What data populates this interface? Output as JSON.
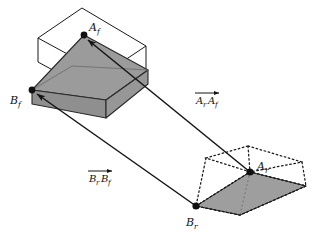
{
  "figure": {
    "type": "geometric-vector-diagram",
    "title": "",
    "background_color": "#ffffff",
    "stroke_color": "#1a1a1a",
    "fill_gray": "#9b9b9b",
    "fill_gray_flat": "#9e9e9e"
  },
  "points": {
    "A_f": {
      "label": "A",
      "subscript": "f",
      "x": 84,
      "y": 35,
      "marker": "filled-dot"
    },
    "B_f": {
      "label": "B",
      "subscript": "f",
      "x": 32,
      "y": 90,
      "marker": "filled-dot"
    },
    "A_r": {
      "label": "A",
      "subscript": "r",
      "x": 250,
      "y": 172,
      "marker": "filled-dot"
    },
    "B_r": {
      "label": "B",
      "subscript": "r",
      "x": 196,
      "y": 206,
      "marker": "filled-dot"
    }
  },
  "point_labels": [
    {
      "name": "A_f",
      "base": "A",
      "sub": "f",
      "tx": 88,
      "ty": 31
    },
    {
      "name": "B_f",
      "base": "B",
      "sub": "f",
      "tx": 10,
      "ty": 104
    },
    {
      "name": "A_r",
      "base": "A",
      "sub": "r",
      "tx": 256,
      "ty": 170
    },
    {
      "name": "B_r",
      "base": "B",
      "sub": "r",
      "tx": 186,
      "ty": 226
    }
  ],
  "vectors": [
    {
      "name": "vector-ArAf",
      "base1": "A",
      "sub1": "r",
      "base2": "A",
      "sub2": "f",
      "from_point": "A_r",
      "to_point": "A_f",
      "from_x": 250,
      "from_y": 172,
      "to_x": 84,
      "to_y": 35,
      "label_x": 196,
      "label_y": 101,
      "overbar": true,
      "arrow_at": "end"
    },
    {
      "name": "vector-BrBf",
      "base1": "B",
      "sub1": "r",
      "base2": "B",
      "sub2": "f",
      "from_point": "B_r",
      "to_point": "B_f",
      "from_x": 196,
      "from_y": 206,
      "to_x": 32,
      "to_y": 90,
      "label_x": 89,
      "label_y": 179,
      "overbar": true,
      "arrow_at": "end"
    }
  ],
  "shapes": {
    "front_solid": {
      "name": "front-solid-parallelepiped",
      "description": "gray filled truncated box at front position",
      "fill": "#9b9b9b",
      "stroke": "#2a2a2a"
    },
    "front_wireframe": {
      "name": "front-wireframe-box",
      "description": "thin outline bounding parallelepiped around front solid",
      "fill": "none",
      "stroke": "#1a1a1a"
    },
    "rear_flat": {
      "name": "rear-flat-parallelogram",
      "description": "gray flattened base quad at rear position",
      "fill": "#9e9e9e",
      "stroke": "#2a2a2a"
    },
    "rear_dotted": {
      "name": "rear-dotted-box",
      "description": "dotted outline of collapsed box at rear position",
      "fill": "none",
      "stroke": "#1a1a1a",
      "dash": "1.6 2.6"
    }
  }
}
